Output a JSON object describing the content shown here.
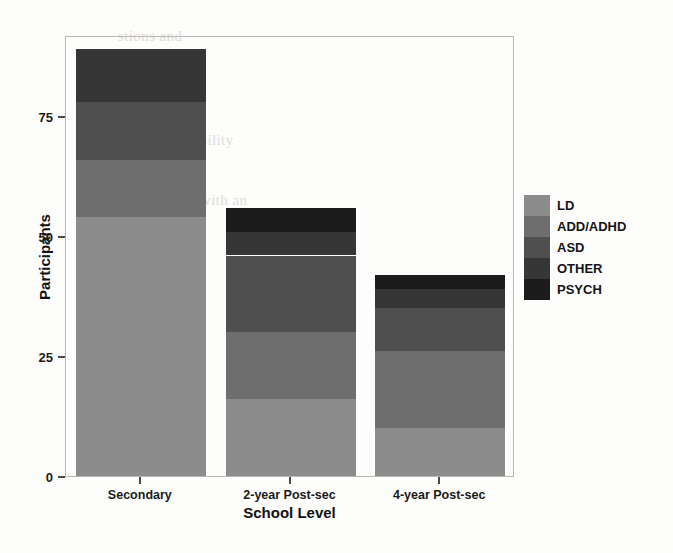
{
  "chart_data": {
    "type": "bar",
    "stacked": true,
    "title": "",
    "xlabel": "School Level",
    "ylabel": "Participants",
    "categories": [
      "Secondary",
      "2-year Post-sec",
      "4-year Post-sec"
    ],
    "series": [
      {
        "name": "LD",
        "color": "#8c8c8c",
        "values": [
          54,
          16,
          10
        ]
      },
      {
        "name": "ADD/ADHD",
        "color": "#6e6e6e",
        "values": [
          12,
          14,
          16
        ]
      },
      {
        "name": "ASD",
        "color": "#4f4f4f",
        "values": [
          12,
          16,
          9
        ]
      },
      {
        "name": "OTHER",
        "color": "#363636",
        "values": [
          11,
          5,
          4
        ]
      },
      {
        "name": "PSYCH",
        "color": "#1c1c1c",
        "values": [
          0,
          5,
          3
        ]
      }
    ],
    "totals": [
      89,
      56,
      42
    ],
    "ylim": [
      0,
      92
    ],
    "yticks": [
      0,
      25,
      50,
      75
    ],
    "ytick_labels": [
      "0",
      "25",
      "50",
      "75"
    ],
    "grid": false,
    "legend_position": "right",
    "legend_title": ""
  },
  "axes": {
    "y_label": "Participants",
    "x_label": "School Level"
  },
  "background_text": {
    "line1": "stions and",
    "line2": "of the",
    "line3": "on a special",
    "line4": "ns is a",
    "line5": "t and disability",
    "line6": "cation",
    "line7": "with an"
  }
}
